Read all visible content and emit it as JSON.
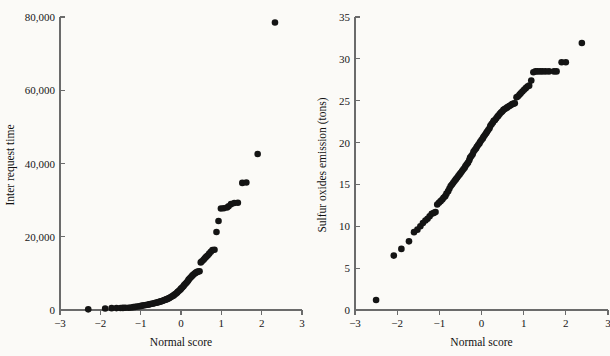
{
  "figure": {
    "background_color": "#fbfaf7",
    "ink_color": "#141414",
    "axis_color": "#6b6b6b",
    "panel_count": 2
  },
  "chart_data": [
    {
      "id": "inter-request-time-qq",
      "type": "scatter",
      "title": "",
      "xlabel": "Normal score",
      "ylabel": "Inter request time",
      "xlim": [
        -3,
        3
      ],
      "ylim": [
        0,
        80000
      ],
      "xticks": [
        -3,
        -2,
        -1,
        0,
        1,
        2,
        3
      ],
      "xticklabels": [
        "−3",
        "−2",
        "−1",
        "0",
        "1",
        "2",
        "3"
      ],
      "yticks": [
        0,
        20000,
        40000,
        60000,
        80000
      ],
      "yticklabels": [
        "0",
        "20,000",
        "40,000",
        "60,000",
        "80,000"
      ],
      "grid": false,
      "legend": false,
      "marker": "filled-circle",
      "marker_size_px": 4.6,
      "x": [
        -2.3,
        -1.88,
        -1.72,
        -1.6,
        -1.5,
        -1.44,
        -1.38,
        -1.3,
        -1.24,
        -1.18,
        -1.13,
        -1.08,
        -1.03,
        -0.99,
        -0.95,
        -0.91,
        -0.87,
        -0.83,
        -0.79,
        -0.76,
        -0.72,
        -0.69,
        -0.65,
        -0.62,
        -0.59,
        -0.56,
        -0.53,
        -0.5,
        -0.47,
        -0.44,
        -0.41,
        -0.38,
        -0.35,
        -0.32,
        -0.29,
        -0.27,
        -0.24,
        -0.21,
        -0.18,
        -0.16,
        -0.13,
        -0.1,
        -0.08,
        -0.05,
        -0.02,
        0.0,
        0.03,
        0.06,
        0.08,
        0.11,
        0.14,
        0.17,
        0.19,
        0.22,
        0.25,
        0.28,
        0.31,
        0.34,
        0.37,
        0.4,
        0.43,
        0.46,
        0.49,
        0.52,
        0.56,
        0.59,
        0.62,
        0.66,
        0.7,
        0.74,
        0.78,
        0.83,
        0.88,
        0.93,
        0.99,
        1.06,
        1.14,
        1.18,
        1.24,
        1.32,
        1.41,
        1.52,
        1.62,
        1.9,
        2.33
      ],
      "y": [
        180,
        420,
        500,
        520,
        560,
        580,
        600,
        620,
        700,
        780,
        860,
        950,
        1030,
        1120,
        1200,
        1280,
        1370,
        1450,
        1530,
        1620,
        1700,
        1790,
        1880,
        1960,
        2050,
        2150,
        2250,
        2350,
        2460,
        2580,
        2700,
        2830,
        2960,
        3100,
        3260,
        3420,
        3600,
        3790,
        3990,
        4200,
        4430,
        4680,
        4950,
        5230,
        5520,
        5830,
        6140,
        6460,
        6800,
        7150,
        7520,
        7900,
        8280,
        8660,
        9030,
        9380,
        9700,
        9980,
        10200,
        10400,
        10520,
        10580,
        13000,
        13300,
        13700,
        14100,
        14500,
        14900,
        15400,
        15900,
        16400,
        16450,
        21300,
        24300,
        27700,
        27800,
        28000,
        28300,
        28900,
        29200,
        29300,
        34700,
        34800,
        42600,
        78500
      ]
    },
    {
      "id": "sulfur-oxides-emission-qq",
      "type": "scatter",
      "title": "",
      "xlabel": "Normal score",
      "ylabel": "Sulfur oxides emission (tons)",
      "xlim": [
        -3,
        3
      ],
      "ylim": [
        0,
        35
      ],
      "xticks": [
        -3,
        -2,
        -1,
        0,
        1,
        2,
        3
      ],
      "xticklabels": [
        "−3",
        "−2",
        "−1",
        "0",
        "1",
        "2",
        "3"
      ],
      "yticks": [
        0,
        5,
        10,
        15,
        20,
        25,
        30,
        35
      ],
      "yticklabels": [
        "0",
        "5",
        "10",
        "15",
        "20",
        "25",
        "30",
        "35"
      ],
      "grid": false,
      "legend": false,
      "marker": "filled-circle",
      "marker_size_px": 4.6,
      "x": [
        -2.5,
        -2.08,
        -1.9,
        -1.72,
        -1.6,
        -1.52,
        -1.45,
        -1.39,
        -1.33,
        -1.28,
        -1.23,
        -1.18,
        -1.13,
        -1.09,
        -1.05,
        -1.01,
        -0.97,
        -0.93,
        -0.9,
        -0.86,
        -0.83,
        -0.79,
        -0.76,
        -0.73,
        -0.7,
        -0.67,
        -0.64,
        -0.61,
        -0.58,
        -0.55,
        -0.52,
        -0.49,
        -0.46,
        -0.43,
        -0.4,
        -0.38,
        -0.35,
        -0.32,
        -0.29,
        -0.27,
        -0.24,
        -0.21,
        -0.19,
        -0.16,
        -0.13,
        -0.11,
        -0.08,
        -0.05,
        -0.03,
        0.0,
        0.03,
        0.05,
        0.08,
        0.11,
        0.13,
        0.16,
        0.19,
        0.21,
        0.24,
        0.27,
        0.29,
        0.32,
        0.35,
        0.38,
        0.4,
        0.43,
        0.46,
        0.49,
        0.52,
        0.55,
        0.58,
        0.61,
        0.64,
        0.67,
        0.7,
        0.73,
        0.76,
        0.79,
        0.83,
        0.86,
        0.9,
        0.93,
        0.97,
        1.01,
        1.05,
        1.09,
        1.13,
        1.18,
        1.23,
        1.28,
        1.33,
        1.39,
        1.45,
        1.52,
        1.6,
        1.72,
        1.78,
        1.9,
        2.0,
        2.38
      ],
      "y": [
        1.2,
        6.5,
        7.3,
        8.2,
        9.3,
        9.6,
        10.0,
        10.4,
        10.7,
        10.9,
        11.2,
        11.5,
        11.6,
        11.7,
        12.6,
        12.8,
        13.0,
        13.2,
        13.4,
        13.6,
        13.9,
        14.2,
        14.5,
        14.8,
        15.0,
        15.2,
        15.4,
        15.6,
        15.8,
        16.0,
        16.2,
        16.4,
        16.6,
        16.8,
        17.0,
        17.2,
        17.4,
        17.6,
        17.9,
        18.2,
        18.4,
        18.6,
        18.9,
        19.1,
        19.3,
        19.5,
        19.7,
        19.9,
        20.1,
        20.3,
        20.5,
        20.7,
        20.9,
        21.1,
        21.3,
        21.5,
        21.7,
        22.0,
        22.2,
        22.4,
        22.6,
        22.7,
        22.9,
        23.1,
        23.2,
        23.4,
        23.6,
        23.7,
        23.9,
        24.0,
        24.1,
        24.2,
        24.3,
        24.4,
        24.5,
        24.6,
        24.65,
        24.7,
        25.4,
        25.5,
        25.7,
        25.9,
        26.1,
        26.3,
        26.5,
        26.7,
        26.8,
        27.4,
        28.4,
        28.5,
        28.5,
        28.5,
        28.5,
        28.5,
        28.5,
        28.5,
        28.5,
        29.6,
        29.6,
        31.9
      ]
    }
  ]
}
